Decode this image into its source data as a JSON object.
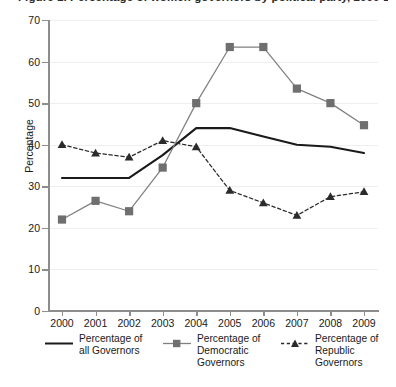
{
  "chart_data": {
    "type": "line",
    "title": "Figure 1. Percentage of women governors by political party, 2000-2009",
    "xlabel": "",
    "ylabel": "Percentage",
    "x": [
      "2000",
      "2001",
      "2002",
      "2003",
      "2004",
      "2005",
      "2006",
      "2007",
      "2008",
      "2009"
    ],
    "categories": [
      "2000",
      "2001",
      "2002",
      "2003",
      "2004",
      "2005",
      "2006",
      "2007",
      "2008",
      "2009"
    ],
    "ylim": [
      0,
      70
    ],
    "yticks": [
      0,
      10,
      20,
      30,
      40,
      50,
      60,
      70
    ],
    "grid": "horizontal",
    "legend_position": "bottom",
    "series": [
      {
        "name": "Percentage of all Governors",
        "marker": "none",
        "linestyle": "solid",
        "color": "#1a1a1a",
        "values": [
          32,
          32,
          32,
          37.5,
          44,
          44,
          42,
          40,
          39.5,
          38
        ]
      },
      {
        "name": "Percentage of Democratic Governors",
        "marker": "square",
        "linestyle": "solid",
        "color": "#808080",
        "values": [
          22,
          26.5,
          24,
          34.5,
          50,
          63.5,
          63.5,
          53.5,
          50,
          44.7
        ]
      },
      {
        "name": "Percentage of Republic Governors",
        "marker": "triangle",
        "linestyle": "dashed",
        "color": "#2b2b2b",
        "values": [
          40,
          38,
          37,
          41,
          39.5,
          29,
          26,
          23,
          27.5,
          28.7
        ]
      }
    ]
  },
  "axes": {
    "y_tick_labels": [
      "70",
      "60",
      "50",
      "40",
      "30",
      "20",
      "10",
      "0"
    ],
    "y_axis_title": "Percentage",
    "x_tick_labels": [
      "2000",
      "2001",
      "2002",
      "2003",
      "2004",
      "2005",
      "2006",
      "2007",
      "2008",
      "2009"
    ]
  },
  "legend": {
    "entries": [
      {
        "label": "Percentage of all Governors",
        "key": "solid-line-key"
      },
      {
        "label": "Percentage of Democratic Governors",
        "key": "square-marker-key"
      },
      {
        "label": "Percentage of Republic Governors",
        "key": "triangle-marker-key"
      }
    ]
  },
  "colors": {
    "all_governors": "#1a1a1a",
    "democratic_governors": "#808080",
    "republic_governors": "#2b2b2b",
    "axis": "#8d8d8d",
    "gridline": "#eeeeee",
    "background": "#ffffff"
  }
}
